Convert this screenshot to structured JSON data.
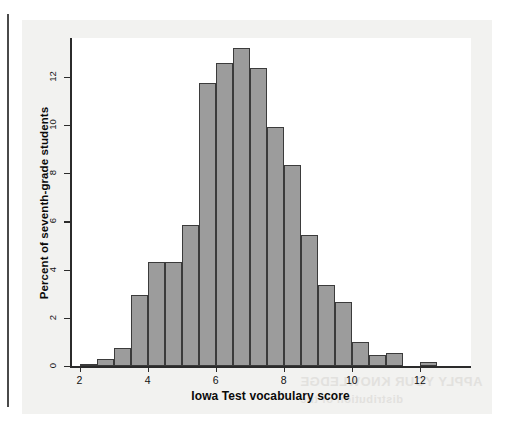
{
  "page": {
    "ghost_text_line1": "APPLY YOUR KNOWLEDGE",
    "ghost_text_line2": "distribution of the"
  },
  "chart_data": {
    "type": "bar",
    "subtype": "histogram",
    "title": "",
    "xlabel": "Iowa Test vocabulary score",
    "ylabel": "Percent of seventh-grade students",
    "xlim": [
      1.75,
      13.5
    ],
    "ylim": [
      0,
      13.6
    ],
    "xticks": [
      2,
      4,
      6,
      8,
      10,
      12
    ],
    "xtick_labels": [
      "2",
      "4",
      "6",
      "8",
      "10",
      "12"
    ],
    "yticks": [
      0,
      2,
      4,
      6,
      8,
      10,
      12
    ],
    "ytick_labels": [
      "0",
      "2",
      "4",
      "6",
      "8",
      "10",
      "12"
    ],
    "grid": false,
    "legend": false,
    "bin_width": 0.5,
    "bar_fill_color": "#9c9c9c",
    "bar_edge_color": "#3b3b3b",
    "bins": [
      {
        "left": 2.0,
        "right": 2.5,
        "center": 2.25,
        "value": 0.1
      },
      {
        "left": 2.5,
        "right": 3.0,
        "center": 2.75,
        "value": 0.3
      },
      {
        "left": 3.0,
        "right": 3.5,
        "center": 3.25,
        "value": 0.75
      },
      {
        "left": 3.5,
        "right": 4.0,
        "center": 3.75,
        "value": 2.95
      },
      {
        "left": 4.0,
        "right": 4.5,
        "center": 4.25,
        "value": 4.3
      },
      {
        "left": 4.5,
        "right": 5.0,
        "center": 4.75,
        "value": 4.3
      },
      {
        "left": 5.0,
        "right": 5.5,
        "center": 5.25,
        "value": 5.85
      },
      {
        "left": 5.5,
        "right": 6.0,
        "center": 5.75,
        "value": 11.75
      },
      {
        "left": 6.0,
        "right": 6.5,
        "center": 6.25,
        "value": 12.55
      },
      {
        "left": 6.5,
        "right": 7.0,
        "center": 6.75,
        "value": 13.2
      },
      {
        "left": 7.0,
        "right": 7.5,
        "center": 7.25,
        "value": 12.35
      },
      {
        "left": 7.5,
        "right": 8.0,
        "center": 7.75,
        "value": 9.9
      },
      {
        "left": 8.0,
        "right": 8.5,
        "center": 8.25,
        "value": 8.35
      },
      {
        "left": 8.5,
        "right": 9.0,
        "center": 8.75,
        "value": 5.45
      },
      {
        "left": 9.0,
        "right": 9.5,
        "center": 9.25,
        "value": 3.35
      },
      {
        "left": 9.5,
        "right": 10.0,
        "center": 9.75,
        "value": 2.65
      },
      {
        "left": 10.0,
        "right": 10.5,
        "center": 10.25,
        "value": 1.0
      },
      {
        "left": 10.5,
        "right": 11.0,
        "center": 10.75,
        "value": 0.45
      },
      {
        "left": 11.0,
        "right": 11.5,
        "center": 11.25,
        "value": 0.55
      },
      {
        "left": 12.0,
        "right": 12.5,
        "center": 12.25,
        "value": 0.15
      }
    ]
  }
}
